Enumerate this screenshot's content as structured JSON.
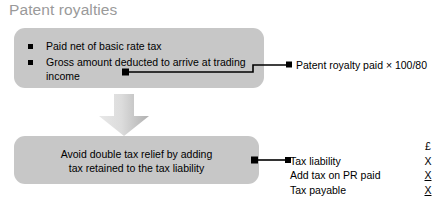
{
  "title": "Patent royalties",
  "boxes": {
    "top": {
      "bullets": [
        "Paid net of basic rate tax",
        "Gross amount deducted to arrive at trading income"
      ]
    },
    "bottom": {
      "line1": "Avoid double tax relief by adding",
      "line2": "tax retained to the tax liability"
    }
  },
  "callouts": {
    "gross_amount": "Patent royalty paid × 100/80"
  },
  "tax_table": {
    "currency_header": "£",
    "rows": [
      {
        "label": "Tax liability",
        "value": "X",
        "underlined": false
      },
      {
        "label": "Add tax on PR paid",
        "value": "X",
        "underlined": true
      },
      {
        "label": "Tax payable",
        "value": "X",
        "underlined": true
      }
    ]
  },
  "icons": {
    "down_arrow": "down-arrow-icon",
    "bullet": "square-bullet-icon",
    "connector_marker": "square-connector-marker-icon"
  },
  "colors": {
    "box_fill": "#c7c7c7",
    "title_text": "#9a9a9a",
    "body_text": "#000000",
    "connector": "#000000",
    "arrow_light": "#e4e4e4",
    "arrow_dark": "#b6b6b6",
    "background": "#ffffff"
  }
}
